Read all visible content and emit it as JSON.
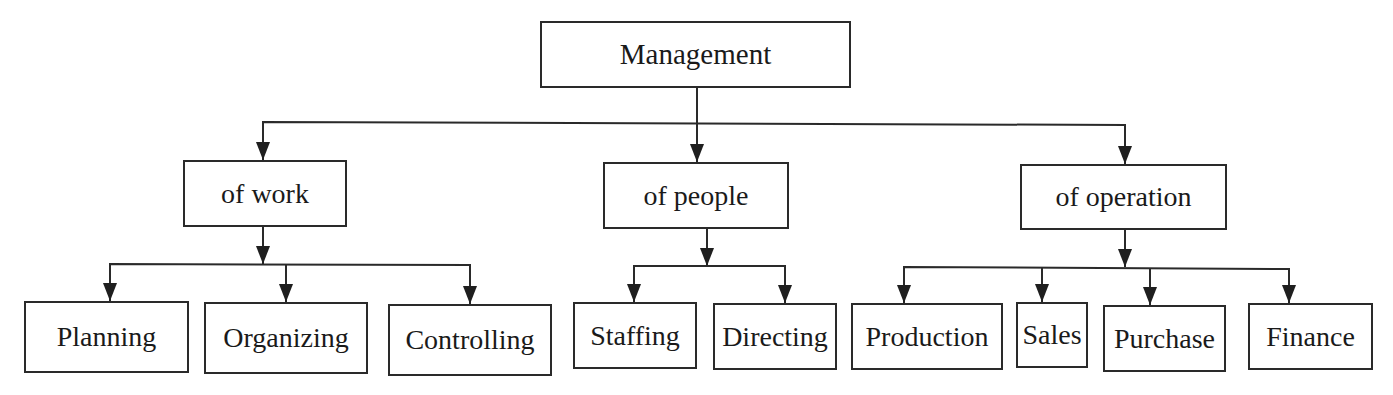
{
  "diagram": {
    "root": {
      "id": "management",
      "label": "Management"
    },
    "branches": [
      {
        "id": "of-work",
        "label": "of work",
        "children": [
          {
            "id": "planning",
            "label": "Planning"
          },
          {
            "id": "organizing",
            "label": "Organizing"
          },
          {
            "id": "controlling",
            "label": "Controlling"
          }
        ]
      },
      {
        "id": "of-people",
        "label": "of people",
        "children": [
          {
            "id": "staffing",
            "label": "Staffing"
          },
          {
            "id": "directing",
            "label": "Directing"
          }
        ]
      },
      {
        "id": "of-operation",
        "label": "of operation",
        "children": [
          {
            "id": "production",
            "label": "Production"
          },
          {
            "id": "sales",
            "label": "Sales"
          },
          {
            "id": "purchase",
            "label": "Purchase"
          },
          {
            "id": "finance",
            "label": "Finance"
          }
        ]
      }
    ],
    "colors": {
      "stroke": "#2a2a2a",
      "background": "#ffffff",
      "text": "#1a1a1a"
    }
  }
}
